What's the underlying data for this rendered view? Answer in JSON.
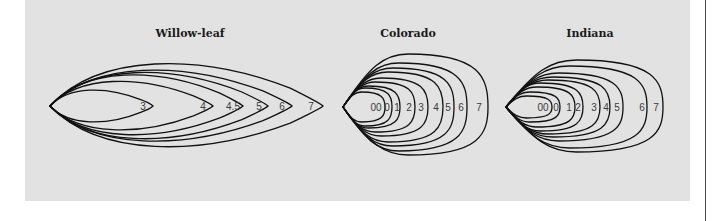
{
  "figure": {
    "panel_color": "#e2e2e2",
    "stroke_color": "#111111",
    "groups": [
      {
        "id": "willow-leaf",
        "title": "Willow-leaf",
        "title_x": 190,
        "tip": [
          50,
          106
        ],
        "shape": "pointed",
        "blades": [
          {
            "label": "3",
            "label_x": 143,
            "right_x": 153,
            "top_y": 88,
            "bottom_y": 124
          },
          {
            "label": "4",
            "label_x": 203,
            "right_x": 213,
            "top_y": 77,
            "bottom_y": 134
          },
          {
            "label": "4.5",
            "label_x": 233,
            "right_x": 243,
            "top_y": 69,
            "bottom_y": 140
          },
          {
            "label": "5",
            "label_x": 259,
            "right_x": 268,
            "top_y": 66,
            "bottom_y": 145
          },
          {
            "label": "6",
            "label_x": 282,
            "right_x": 292,
            "top_y": 63,
            "bottom_y": 148
          },
          {
            "label": "7",
            "label_x": 311,
            "right_x": 323,
            "top_y": 55,
            "bottom_y": 155
          }
        ]
      },
      {
        "id": "colorado",
        "title": "Colorado",
        "title_x": 408,
        "tip": [
          343,
          107
        ],
        "shape": "round",
        "blades": [
          {
            "label": "00",
            "label_x": 376,
            "right_x": 385,
            "top_y": 92,
            "bottom_y": 122
          },
          {
            "label": "0",
            "label_x": 387,
            "right_x": 392,
            "top_y": 88,
            "bottom_y": 126
          },
          {
            "label": "1",
            "label_x": 397,
            "right_x": 400,
            "top_y": 86,
            "bottom_y": 128
          },
          {
            "label": "2",
            "label_x": 409,
            "right_x": 415,
            "top_y": 82,
            "bottom_y": 132
          },
          {
            "label": "3",
            "label_x": 421,
            "right_x": 428,
            "top_y": 78,
            "bottom_y": 136
          },
          {
            "label": "4",
            "label_x": 436,
            "right_x": 443,
            "top_y": 72,
            "bottom_y": 142
          },
          {
            "label": "5",
            "label_x": 448,
            "right_x": 454,
            "top_y": 68,
            "bottom_y": 146
          },
          {
            "label": "6",
            "label_x": 461,
            "right_x": 467,
            "top_y": 63,
            "bottom_y": 151
          },
          {
            "label": "7",
            "label_x": 479,
            "right_x": 488,
            "top_y": 54,
            "bottom_y": 155
          }
        ]
      },
      {
        "id": "indiana",
        "title": "Indiana",
        "title_x": 590,
        "tip": [
          506,
          107
        ],
        "shape": "round",
        "blades": [
          {
            "label": "00",
            "label_x": 543,
            "right_x": 552,
            "top_y": 96,
            "bottom_y": 118
          },
          {
            "label": "0",
            "label_x": 556,
            "right_x": 560,
            "top_y": 92,
            "bottom_y": 122
          },
          {
            "label": "1",
            "label_x": 569,
            "right_x": 575,
            "top_y": 87,
            "bottom_y": 127
          },
          {
            "label": "2",
            "label_x": 578,
            "right_x": 583,
            "top_y": 83,
            "bottom_y": 131
          },
          {
            "label": "3",
            "label_x": 594,
            "right_x": 600,
            "top_y": 80,
            "bottom_y": 134
          },
          {
            "label": "4",
            "label_x": 606,
            "right_x": 610,
            "top_y": 77,
            "bottom_y": 137
          },
          {
            "label": "5",
            "label_x": 617,
            "right_x": 623,
            "top_y": 73,
            "bottom_y": 141
          },
          {
            "label": "6",
            "label_x": 642,
            "right_x": 647,
            "top_y": 66,
            "bottom_y": 148
          },
          {
            "label": "7",
            "label_x": 656,
            "right_x": 663,
            "top_y": 60,
            "bottom_y": 152
          }
        ]
      }
    ]
  }
}
